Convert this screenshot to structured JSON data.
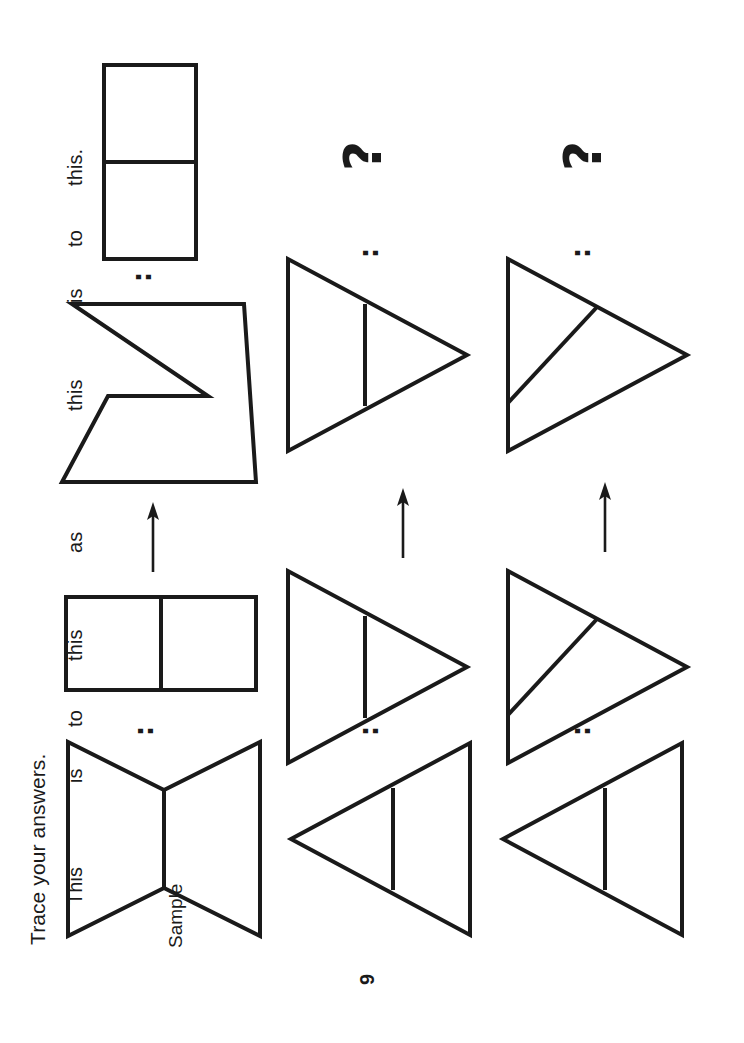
{
  "page": {
    "number": "9",
    "orientation": "rotated-90-ccw",
    "background_color": "#ffffff",
    "ink_color": "#1a1a1a"
  },
  "instruction": {
    "text": "Trace your answers."
  },
  "prompt_words": {
    "this1": "This",
    "is1": "is",
    "to1": "to",
    "this2": "this",
    "as": "as",
    "this3": "this",
    "is2": "is",
    "to2": "to",
    "this4": "this."
  },
  "sample": {
    "label": "Sample"
  },
  "symbols": {
    "ratio_colon": ":",
    "question_mark": "?",
    "arrow": "arrow-up"
  },
  "rows": [
    {
      "id": "row-sample",
      "name": "sample-row",
      "items": [
        {
          "slot": "a",
          "shape": "bowtie-pointed",
          "divider": "vertex-join"
        },
        {
          "slot": "b",
          "shape": "rectangle",
          "divider": "vertical-line"
        },
        {
          "slot": "c",
          "shape": "bowtie-flat-waist",
          "divider": "horizontal-waist"
        },
        {
          "slot": "d",
          "shape": "rectangle-tall",
          "divider": "horizontal-line"
        }
      ],
      "has_answer": true
    },
    {
      "id": "row-1",
      "name": "problem-row-1",
      "items": [
        {
          "slot": "a",
          "shape": "triangle-left",
          "divider": "vertical-line"
        },
        {
          "slot": "b",
          "shape": "triangle-right",
          "divider": "vertical-line"
        },
        {
          "slot": "c",
          "shape": "triangle-left",
          "divider": "vertical-line"
        },
        {
          "slot": "d",
          "shape": "question",
          "divider": "none"
        }
      ],
      "has_answer": false
    },
    {
      "id": "row-2",
      "name": "problem-row-2",
      "items": [
        {
          "slot": "a",
          "shape": "triangle-left",
          "divider": "vertical-line"
        },
        {
          "slot": "b",
          "shape": "triangle-right",
          "divider": "diagonal-line"
        },
        {
          "slot": "c",
          "shape": "triangle-left",
          "divider": "diagonal-line"
        },
        {
          "slot": "d",
          "shape": "question",
          "divider": "none"
        }
      ],
      "has_answer": false
    }
  ]
}
